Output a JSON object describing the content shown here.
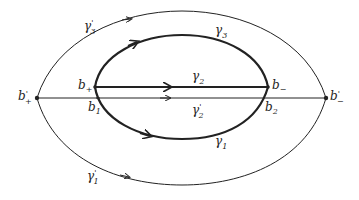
{
  "diagram": {
    "stroke_color": "#222222",
    "background": "#ffffff",
    "labels": {
      "gamma3_prime": {
        "base": "γ",
        "sub": "3",
        "sup": "'"
      },
      "gamma3": {
        "base": "γ",
        "sub": "3"
      },
      "gamma2": {
        "base": "γ",
        "sub": "2"
      },
      "gamma2_prime": {
        "base": "γ",
        "sub": "2",
        "sup": "'"
      },
      "gamma1": {
        "base": "γ",
        "sub": "1"
      },
      "gamma1_prime": {
        "base": "γ",
        "sub": "1",
        "sup": "'"
      },
      "b_plus": {
        "base": "b",
        "sub": "+"
      },
      "b_minus": {
        "base": "b",
        "sub": "−"
      },
      "b1": {
        "base": "b",
        "sub": "1"
      },
      "b2": {
        "base": "b",
        "sub": "2"
      },
      "b_plus_prime": {
        "base": "b",
        "sub": "+",
        "sup": "'"
      },
      "b_minus_prime": {
        "base": "b",
        "sub": "−",
        "sup": "'"
      }
    }
  }
}
